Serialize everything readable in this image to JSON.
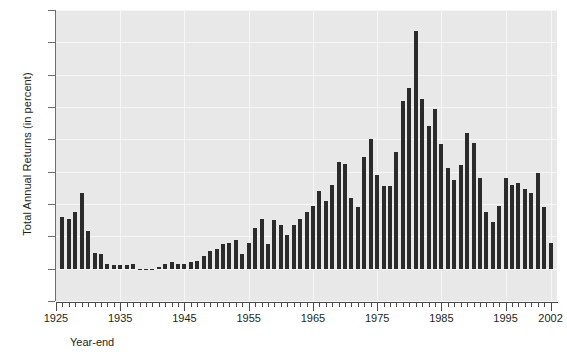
{
  "chart_data": {
    "type": "bar",
    "title": "",
    "subtitle": "",
    "xlabel": "Year-end",
    "ylabel": "Total Annual Returns (in percent)",
    "ylim": [
      -2,
      16
    ],
    "xlim": [
      1925,
      2003
    ],
    "yticks": [
      -2,
      0,
      2,
      4,
      6,
      8,
      10,
      12,
      14,
      16
    ],
    "ytick_labels": [
      "-2",
      "0",
      "2",
      "4",
      "6",
      "8",
      "10",
      "12",
      "14",
      "16"
    ],
    "xtick_labels": [
      "1925",
      "1935",
      "1945",
      "1955",
      "1965",
      "1975",
      "1985",
      "1995",
      "2002"
    ],
    "xtick_values": [
      1925,
      1935,
      1945,
      1955,
      1965,
      1975,
      1985,
      1995,
      2002
    ],
    "grid": true,
    "grid_axis": "both",
    "legend": "none",
    "bar_color": "#2b2b2b",
    "plot_background": "#e8e8e8",
    "categories": [
      1926,
      1927,
      1928,
      1929,
      1930,
      1931,
      1932,
      1933,
      1934,
      1935,
      1936,
      1937,
      1938,
      1939,
      1940,
      1941,
      1942,
      1943,
      1944,
      1945,
      1946,
      1947,
      1948,
      1949,
      1950,
      1951,
      1952,
      1953,
      1954,
      1955,
      1956,
      1957,
      1958,
      1959,
      1960,
      1961,
      1962,
      1963,
      1964,
      1965,
      1966,
      1967,
      1968,
      1969,
      1970,
      1971,
      1972,
      1973,
      1974,
      1975,
      1976,
      1977,
      1978,
      1979,
      1980,
      1981,
      1982,
      1983,
      1984,
      1985,
      1986,
      1987,
      1988,
      1989,
      1990,
      1991,
      1992,
      1993,
      1994,
      1995,
      1996,
      1997,
      1998,
      1999,
      2000,
      2001,
      2002
    ],
    "values": [
      3.2,
      3.1,
      3.5,
      4.7,
      2.3,
      1.0,
      0.9,
      0.3,
      0.2,
      0.2,
      0.2,
      0.3,
      0.0,
      0.0,
      0.0,
      0.1,
      0.3,
      0.4,
      0.3,
      0.3,
      0.4,
      0.5,
      0.8,
      1.1,
      1.2,
      1.5,
      1.6,
      1.8,
      0.9,
      1.6,
      2.5,
      3.1,
      1.5,
      3.0,
      2.7,
      2.1,
      2.7,
      3.1,
      3.5,
      3.9,
      4.8,
      4.2,
      5.2,
      6.6,
      6.5,
      4.4,
      3.8,
      6.9,
      8.0,
      5.8,
      5.1,
      5.1,
      7.2,
      10.4,
      11.2,
      14.7,
      10.5,
      8.8,
      9.9,
      7.7,
      6.2,
      5.5,
      6.4,
      8.4,
      7.8,
      5.6,
      3.5,
      2.9,
      3.9,
      5.6,
      5.2,
      5.3,
      4.9,
      4.7,
      5.9,
      3.8,
      1.6
    ],
    "data_label_note": "Bar heights read from axis gridlines; units are percent."
  },
  "chart": {
    "y_axis_title": "Total Annual Returns (in percent)",
    "x_axis_title": "Year-end"
  }
}
